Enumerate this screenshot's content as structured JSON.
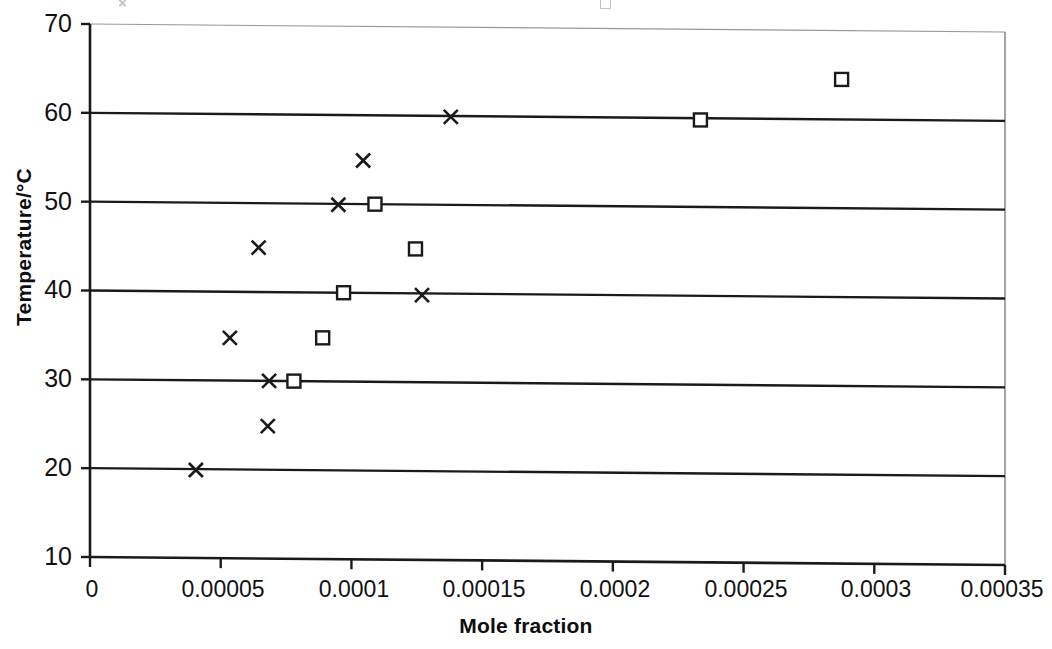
{
  "chart_data": {
    "type": "scatter",
    "title": "",
    "xlabel": "Mole fraction",
    "ylabel": "Temperature/°C",
    "xlim": [
      0,
      0.00035
    ],
    "ylim": [
      10,
      70
    ],
    "xticks": [
      "0",
      "0.00005",
      "0.0001",
      "0.00015",
      "0.0002",
      "0.00025",
      "0.0003",
      "0.00035"
    ],
    "xtick_values": [
      0,
      5e-05,
      0.0001,
      0.00015,
      0.0002,
      0.00025,
      0.0003,
      0.00035
    ],
    "yticks": [
      "70",
      "60",
      "50",
      "40",
      "30",
      "20",
      "10"
    ],
    "ytick_values": [
      70,
      60,
      50,
      40,
      30,
      20,
      10
    ],
    "grid": "horizontal",
    "legend_position": "top-cropped",
    "series": [
      {
        "name": "series-cross",
        "marker": "cross",
        "color": "#1a1a1a",
        "points": [
          {
            "x": 4.05e-05,
            "y": 19.9
          },
          {
            "x": 6.8e-05,
            "y": 24.9
          },
          {
            "x": 5.35e-05,
            "y": 34.8
          },
          {
            "x": 6.85e-05,
            "y": 30.0
          },
          {
            "x": 0.000127,
            "y": 39.8
          },
          {
            "x": 6.45e-05,
            "y": 45.0
          },
          {
            "x": 9.5e-05,
            "y": 49.9
          },
          {
            "x": 0.0001045,
            "y": 54.9
          },
          {
            "x": 0.000138,
            "y": 59.9
          }
        ]
      },
      {
        "name": "series-square",
        "marker": "square",
        "color": "#1a1a1a",
        "points": [
          {
            "x": 7.8e-05,
            "y": 30.0
          },
          {
            "x": 8.9e-05,
            "y": 34.9
          },
          {
            "x": 9.7e-05,
            "y": 40.0
          },
          {
            "x": 0.0001245,
            "y": 45.0
          },
          {
            "x": 0.000109,
            "y": 50.0
          },
          {
            "x": 0.0002335,
            "y": 59.8
          },
          {
            "x": 0.0002875,
            "y": 64.5
          }
        ]
      }
    ]
  },
  "legend_cropped": {
    "items": [
      "□",
      "×"
    ]
  }
}
